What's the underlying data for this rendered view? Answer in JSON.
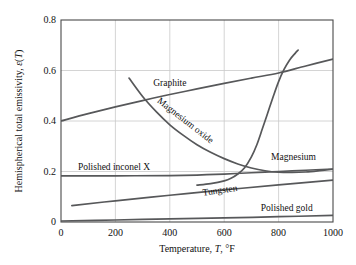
{
  "chart_data": {
    "type": "line",
    "title": "",
    "xlabel": "Temperature, T, °F",
    "ylabel": "Hemispherical total emissivity, ε(T)",
    "xlim": [
      0,
      1000
    ],
    "ylim": [
      0,
      0.8
    ],
    "xticks": [
      "0",
      "200",
      "400",
      "600",
      "800",
      "1000"
    ],
    "yticks": [
      "0",
      "0.2",
      "0.4",
      "0.6",
      "0.8"
    ],
    "grid": true,
    "legend_position": "inline-labels",
    "line_color": "#57585a",
    "grid_color": "#c9c9c9",
    "axis_color": "#4a4a4a",
    "series": [
      {
        "name": "Graphite",
        "label": "Graphite",
        "x": [
          0,
          100,
          200,
          300,
          400,
          500,
          600,
          700,
          800,
          900,
          1000
        ],
        "values": [
          0.4,
          0.429,
          0.456,
          0.481,
          0.505,
          0.527,
          0.549,
          0.57,
          0.59,
          0.618,
          0.645
        ]
      },
      {
        "name": "Magnesium oxide",
        "label": "Magnesium oxide",
        "x": [
          250,
          300,
          350,
          400,
          450,
          500,
          550,
          600,
          650,
          700,
          750,
          800,
          850,
          900,
          950,
          1000
        ],
        "values": [
          0.57,
          0.497,
          0.437,
          0.385,
          0.343,
          0.306,
          0.276,
          0.251,
          0.23,
          0.214,
          0.203,
          0.197,
          0.196,
          0.198,
          0.203,
          0.209
        ]
      },
      {
        "name": "Magnesium",
        "label": "Magnesium",
        "x": [
          500,
          550,
          600,
          625,
          650,
          675,
          700,
          720,
          740,
          760,
          780,
          800,
          820,
          840,
          860,
          872
        ],
        "values": [
          0.146,
          0.152,
          0.163,
          0.173,
          0.19,
          0.215,
          0.258,
          0.306,
          0.368,
          0.432,
          0.496,
          0.556,
          0.604,
          0.641,
          0.667,
          0.681
        ]
      },
      {
        "name": "Polished inconel X",
        "label": "Polished inconel X",
        "x": [
          0,
          200,
          400,
          500,
          600,
          700,
          800,
          900,
          1000
        ],
        "values": [
          0.183,
          0.183,
          0.184,
          0.186,
          0.19,
          0.195,
          0.2,
          0.205,
          0.21
        ]
      },
      {
        "name": "Tungsten",
        "label": "Tungsten",
        "x": [
          40,
          200,
          400,
          600,
          800,
          1000
        ],
        "values": [
          0.065,
          0.084,
          0.106,
          0.127,
          0.147,
          0.166
        ]
      },
      {
        "name": "Polished gold",
        "label": "Polished gold",
        "x": [
          0,
          200,
          400,
          600,
          800,
          1000
        ],
        "values": [
          0.004,
          0.008,
          0.012,
          0.016,
          0.021,
          0.026
        ]
      }
    ],
    "annotations": [
      {
        "text": "Graphite",
        "x": 400,
        "y": 0.545,
        "rotation": 0
      },
      {
        "text": "Magnesium oxide",
        "x": 455,
        "y": 0.4,
        "rotation": 38
      },
      {
        "text": "Magnesium",
        "x": 855,
        "y": 0.255,
        "rotation": 0
      },
      {
        "text": "Polished inconel X",
        "x": 195,
        "y": 0.212,
        "rotation": 0
      },
      {
        "text": "Tungsten",
        "x": 585,
        "y": 0.122,
        "rotation": -8
      },
      {
        "text": "Polished gold",
        "x": 830,
        "y": 0.053,
        "rotation": 0
      }
    ]
  }
}
